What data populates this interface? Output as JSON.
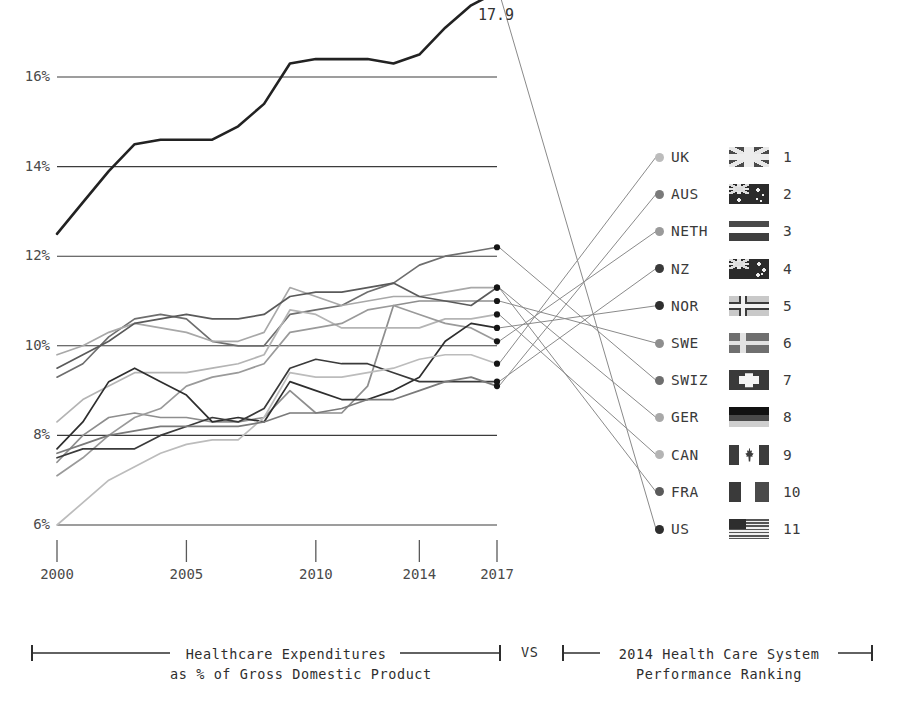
{
  "chart_data": {
    "type": "line",
    "title": "",
    "xlabel": "",
    "ylabel": "",
    "grid": true,
    "legend_position": "right",
    "x": [
      2000,
      2001,
      2002,
      2003,
      2004,
      2005,
      2006,
      2007,
      2008,
      2009,
      2010,
      2011,
      2012,
      2013,
      2014,
      2015,
      2016,
      2017
    ],
    "xtick_labels": [
      "2000",
      "2005",
      "2010",
      "2014",
      "2017"
    ],
    "xtick_values": [
      2000,
      2005,
      2010,
      2014,
      2017
    ],
    "ytick_labels": [
      "6%",
      "8%",
      "10%",
      "12%",
      "14%",
      "16%"
    ],
    "ytick_values": [
      6,
      8,
      10,
      12,
      14,
      16
    ],
    "ylim": [
      5.2,
      18.2
    ],
    "xlim": [
      2000,
      2017
    ],
    "annotations": [
      {
        "label": "17.9",
        "series": "US",
        "x": 2017,
        "y": 17.9
      }
    ],
    "series": [
      {
        "name": "US",
        "rank": 11,
        "color": "#222222",
        "values": [
          12.5,
          13.2,
          13.9,
          14.5,
          14.6,
          14.6,
          14.6,
          14.9,
          15.4,
          16.3,
          16.4,
          16.4,
          16.4,
          16.3,
          16.5,
          17.1,
          17.6,
          17.9
        ]
      },
      {
        "name": "SWIZ",
        "rank": 7,
        "color": "#6e6e6e",
        "values": [
          9.3,
          9.6,
          10.2,
          10.6,
          10.7,
          10.6,
          10.1,
          10.0,
          10.0,
          10.7,
          10.8,
          10.9,
          11.2,
          11.4,
          11.8,
          12.0,
          12.1,
          12.2
        ]
      },
      {
        "name": "GER",
        "rank": 8,
        "color": "#a8a8a8",
        "values": [
          9.8,
          10.0,
          10.3,
          10.5,
          10.4,
          10.3,
          10.1,
          10.1,
          10.3,
          11.3,
          11.1,
          10.9,
          11.0,
          11.1,
          11.1,
          11.2,
          11.3,
          11.3
        ]
      },
      {
        "name": "SWE",
        "rank": 6,
        "color": "#8e8e8e",
        "values": [
          7.4,
          8.0,
          8.4,
          8.5,
          8.4,
          8.4,
          8.3,
          8.3,
          8.4,
          9.0,
          8.5,
          8.5,
          9.1,
          10.9,
          11.0,
          11.0,
          11.0,
          11.0
        ]
      },
      {
        "name": "FRA",
        "rank": 10,
        "color": "#5a5a5a",
        "values": [
          9.5,
          9.8,
          10.1,
          10.5,
          10.6,
          10.7,
          10.6,
          10.6,
          10.7,
          11.1,
          11.2,
          11.2,
          11.3,
          11.4,
          11.1,
          11.0,
          10.9,
          11.3
        ]
      },
      {
        "name": "CAN",
        "rank": 9,
        "color": "#b4b4b4",
        "values": [
          8.3,
          8.8,
          9.1,
          9.4,
          9.4,
          9.4,
          9.5,
          9.6,
          9.8,
          10.8,
          10.7,
          10.4,
          10.4,
          10.4,
          10.4,
          10.6,
          10.6,
          10.7
        ]
      },
      {
        "name": "NETH",
        "rank": 3,
        "color": "#9a9a9a",
        "values": [
          7.1,
          7.5,
          8.0,
          8.4,
          8.6,
          9.1,
          9.3,
          9.4,
          9.6,
          10.3,
          10.4,
          10.5,
          10.8,
          10.9,
          10.7,
          10.5,
          10.4,
          10.1
        ]
      },
      {
        "name": "NOR",
        "rank": 5,
        "color": "#2e2e2e",
        "values": [
          7.7,
          8.3,
          9.2,
          9.5,
          9.2,
          8.9,
          8.3,
          8.4,
          8.3,
          9.2,
          9.0,
          8.8,
          8.8,
          9.0,
          9.3,
          10.1,
          10.5,
          10.4
        ]
      },
      {
        "name": "NZ",
        "rank": 4,
        "color": "#3a3a3a",
        "values": [
          7.5,
          7.7,
          7.7,
          7.7,
          8.0,
          8.2,
          8.4,
          8.3,
          8.6,
          9.5,
          9.7,
          9.6,
          9.6,
          9.4,
          9.2,
          9.2,
          9.2,
          9.2
        ]
      },
      {
        "name": "UK",
        "rank": 1,
        "color": "#bcbcbc",
        "values": [
          6.0,
          6.5,
          7.0,
          7.3,
          7.6,
          7.8,
          7.9,
          7.9,
          8.4,
          9.4,
          9.3,
          9.3,
          9.4,
          9.5,
          9.7,
          9.8,
          9.8,
          9.6
        ]
      },
      {
        "name": "AUS",
        "rank": 2,
        "color": "#7a7a7a",
        "values": [
          7.6,
          7.8,
          8.0,
          8.1,
          8.2,
          8.2,
          8.2,
          8.2,
          8.3,
          8.5,
          8.5,
          8.6,
          8.8,
          8.8,
          9.0,
          9.2,
          9.3,
          9.1
        ]
      }
    ]
  },
  "legend": {
    "items": [
      {
        "name": "UK",
        "rank": "1",
        "flag": "uk-flag",
        "dot_color": "#bcbcbc"
      },
      {
        "name": "AUS",
        "rank": "2",
        "flag": "aus-flag",
        "dot_color": "#7a7a7a"
      },
      {
        "name": "NETH",
        "rank": "3",
        "flag": "neth-flag",
        "dot_color": "#9a9a9a"
      },
      {
        "name": "NZ",
        "rank": "4",
        "flag": "nz-flag",
        "dot_color": "#3a3a3a"
      },
      {
        "name": "NOR",
        "rank": "5",
        "flag": "nor-flag",
        "dot_color": "#2e2e2e"
      },
      {
        "name": "SWE",
        "rank": "6",
        "flag": "swe-flag",
        "dot_color": "#8e8e8e"
      },
      {
        "name": "SWIZ",
        "rank": "7",
        "flag": "swiz-flag",
        "dot_color": "#6e6e6e"
      },
      {
        "name": "GER",
        "rank": "8",
        "flag": "ger-flag",
        "dot_color": "#a8a8a8"
      },
      {
        "name": "CAN",
        "rank": "9",
        "flag": "can-flag",
        "dot_color": "#b4b4b4"
      },
      {
        "name": "FRA",
        "rank": "10",
        "flag": "fra-flag",
        "dot_color": "#5a5a5a"
      },
      {
        "name": "US",
        "rank": "11",
        "flag": "us-flag",
        "dot_color": "#2e2e2e"
      }
    ]
  },
  "caption": {
    "left_line1": "Healthcare Expenditures",
    "left_line2": "as % of Gross Domestic Product",
    "vs": "VS",
    "right_line1": "2014 Health Care System",
    "right_line2": "Performance Ranking"
  },
  "colors": {
    "gridline": "#3c3c3c",
    "text": "#3a3a3a",
    "connector": "#8a8a8a",
    "background": "#ffffff"
  }
}
